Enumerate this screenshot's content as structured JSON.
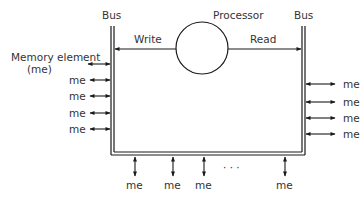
{
  "diagram": {
    "labels": {
      "bus_left": "Bus",
      "bus_right": "Bus",
      "processor": "Processor",
      "write": "Write",
      "read": "Read",
      "memory_element_line1": "Memory element",
      "memory_element_line2": "(me)",
      "ellipsis": "· · ·"
    },
    "left_elements": [
      "me",
      "me",
      "me",
      "me"
    ],
    "right_elements": [
      "me",
      "me",
      "me",
      "me"
    ],
    "bottom_elements": [
      "me",
      "me",
      "me",
      "me"
    ],
    "colors": {
      "line": "#1a1a1a",
      "text": "#333333",
      "background": "#ffffff"
    }
  }
}
